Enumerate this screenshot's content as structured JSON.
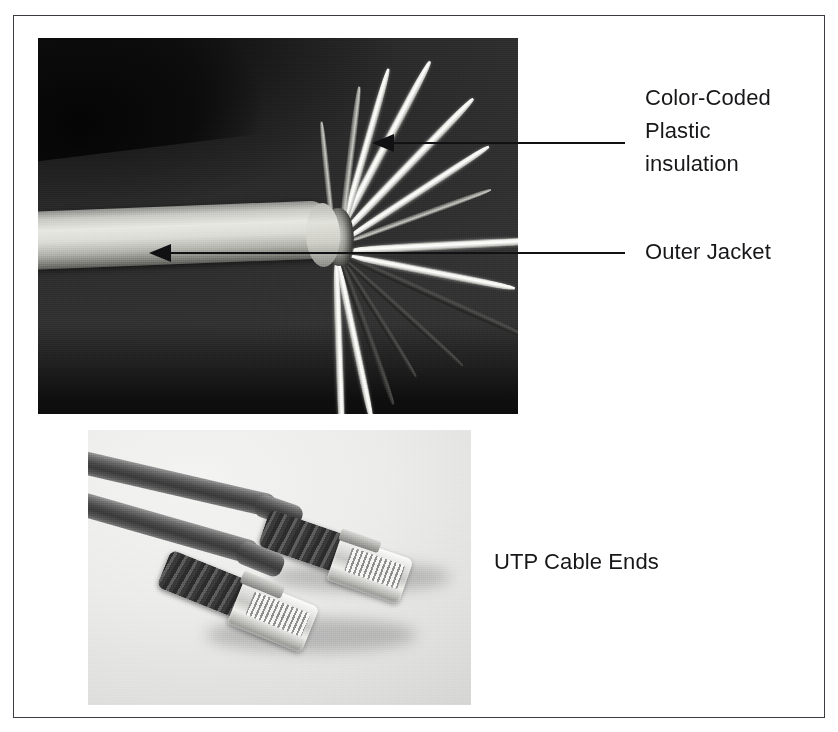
{
  "figure": {
    "type": "annotated-photo-figure",
    "border_color": "#3c3c42",
    "background_color": "#ffffff"
  },
  "photos": [
    {
      "id": "stripped-cable",
      "caption_refs": [
        "color-coded-plastic-insulation",
        "outer-jacket"
      ],
      "description": "Close-up photo of an unshielded twisted pair cable with its outer jacket stripped back, exposing splayed color-coded insulated conductors against a dark background"
    },
    {
      "id": "cable-ends",
      "caption_refs": [
        "utp-cable-ends"
      ],
      "description": "Two RJ45 terminated UTP patch cable ends with ribbed strain-relief boots and clear plastic plugs on a light gray background"
    }
  ],
  "annotations": [
    {
      "id": "color-coded-plastic-insulation",
      "lines": [
        "Color-Coded",
        "Plastic",
        "insulation"
      ],
      "leader": {
        "has_arrow": true,
        "direction": "left"
      }
    },
    {
      "id": "outer-jacket",
      "lines": [
        "Outer Jacket"
      ],
      "leader": {
        "has_arrow": true,
        "direction": "left"
      }
    }
  ],
  "captions": [
    {
      "id": "utp-cable-ends",
      "text": "UTP Cable Ends"
    }
  ],
  "labels": {
    "color_coded_line1": "Color-Coded",
    "color_coded_line2": "Plastic",
    "color_coded_line3": "insulation",
    "outer_jacket": "Outer Jacket",
    "utp_cable_ends": "UTP Cable Ends"
  },
  "colors": {
    "text": "#17171a",
    "leader": "#111114",
    "frame": "#3c3c42",
    "page": "#ffffff"
  }
}
